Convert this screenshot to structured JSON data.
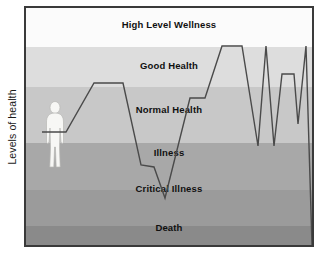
{
  "chart_data": {
    "type": "line",
    "title": "",
    "subtitle": "",
    "xlabel": "",
    "ylabel": "Levels of health",
    "grid": false,
    "legend_position": "none",
    "xlim": [
      0,
      286
    ],
    "ylim": [
      0,
      237
    ],
    "y_axis_direction": "inverted",
    "bands": [
      {
        "label": "High Level Wellness",
        "color": "#fbfbfb",
        "top_pct": 0,
        "height_pct": 16.5,
        "label_top_pct": 4.5
      },
      {
        "label": "Good Health",
        "color": "#dddddd",
        "height_pct": 17.0,
        "top_pct": 16.5,
        "label_top_pct": 22.0
      },
      {
        "label": "Normal Health",
        "color": "#c8c8c8",
        "height_pct": 23.5,
        "top_pct": 33.5,
        "label_top_pct": 40.5
      },
      {
        "label": "Illness",
        "color": "#a8a8a8",
        "height_pct": 20.0,
        "top_pct": 57.0,
        "label_top_pct": 58.8
      },
      {
        "label": "Critical Illness",
        "color": "#9b9b9b",
        "height_pct": 15.0,
        "top_pct": 77.0,
        "label_top_pct": 74.0
      },
      {
        "label": "Death",
        "color": "#8a8a8a",
        "height_pct": 8.0,
        "top_pct": 92.0,
        "label_top_pct": 90.5
      }
    ],
    "series": [
      {
        "name": "Health level over time",
        "color": "#4a4a4a",
        "points": [
          [
            16,
            124
          ],
          [
            40,
            124
          ],
          [
            68,
            75
          ],
          [
            97,
            75
          ],
          [
            115,
            157
          ],
          [
            128,
            159
          ],
          [
            139,
            190
          ],
          [
            164,
            90
          ],
          [
            179,
            90
          ],
          [
            196,
            38
          ],
          [
            216,
            38
          ],
          [
            232,
            138
          ],
          [
            240,
            38
          ],
          [
            248,
            138
          ],
          [
            256,
            66
          ],
          [
            268,
            66
          ],
          [
            272,
            116
          ],
          [
            280,
            38
          ],
          [
            286,
            237
          ]
        ]
      }
    ],
    "annotations": [
      {
        "type": "human-silhouette",
        "name": "person-figure",
        "x": 21,
        "y": 94,
        "width": 16,
        "height": 66
      }
    ]
  },
  "axis": {
    "y_label": "Levels of health"
  },
  "frame": {
    "border_color": "#3a3a3a"
  }
}
